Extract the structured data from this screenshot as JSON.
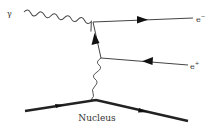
{
  "diagram": {
    "type": "feynman",
    "labels": {
      "photon": "γ",
      "electron_base": "e",
      "electron_sup": "−",
      "positron_base": "e",
      "positron_sup": "+",
      "nucleus": "Nucleus"
    },
    "particles": [
      {
        "name": "incoming photon",
        "symbol": "γ",
        "line": "wavy"
      },
      {
        "name": "electron",
        "symbol": "e−",
        "line": "fermion",
        "arrow": "outgoing"
      },
      {
        "name": "positron",
        "symbol": "e+",
        "line": "fermion",
        "arrow": "incoming"
      },
      {
        "name": "virtual photon",
        "line": "wavy"
      },
      {
        "name": "nucleus",
        "symbol": "Nucleus",
        "line": "thick"
      }
    ],
    "colors": {
      "line": "#333333",
      "nucleus": "#222222",
      "text": "#333333"
    }
  }
}
